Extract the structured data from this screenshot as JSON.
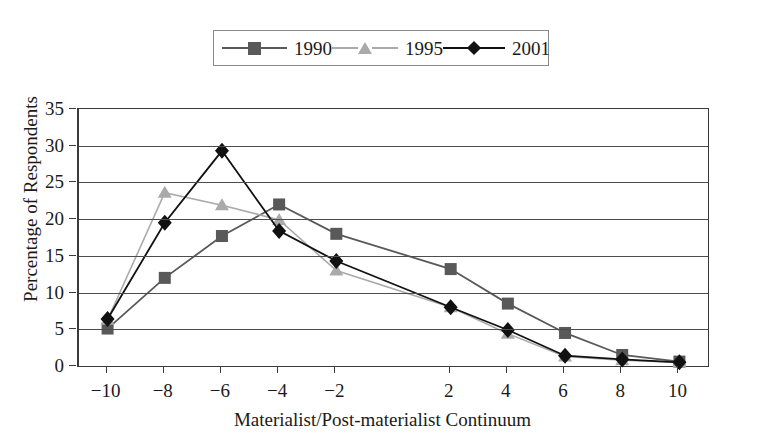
{
  "figure": {
    "ghost_text": "",
    "xlabel": "Materialist/Post-materialist Continuum",
    "ylabel": "Percentage of Respondents"
  },
  "legend": {
    "position": "top-center",
    "entries": [
      {
        "label": "1990",
        "marker": "square",
        "color": "#595959"
      },
      {
        "label": "1995",
        "marker": "triangle",
        "color": "#aaaaaa"
      },
      {
        "label": "2001",
        "marker": "diamond",
        "color": "#111111"
      }
    ]
  },
  "axes": {
    "y_ticks": [
      "0",
      "5",
      "10",
      "15",
      "20",
      "25",
      "30",
      "35"
    ],
    "x_ticks": [
      "−10",
      "−8",
      "−6",
      "−4",
      "−2",
      "2",
      "4",
      "6",
      "8",
      "10"
    ]
  },
  "chart_data": {
    "type": "line",
    "title": "",
    "subtitle": "",
    "xlabel": "Materialist/Post-materialist Continuum",
    "ylabel": "Percentage of Respondents",
    "categories": [
      "-10",
      "-8",
      "-6",
      "-4",
      "-2",
      "2",
      "4",
      "6",
      "8",
      "10"
    ],
    "x": [
      -10,
      -8,
      -6,
      -4,
      -2,
      2,
      4,
      6,
      8,
      10
    ],
    "xlim": [
      -11,
      11
    ],
    "ylim": [
      0,
      35
    ],
    "ytick_step": 5,
    "grid": "horizontal",
    "legend_position": "top-center",
    "series": [
      {
        "name": "1990",
        "marker": "square",
        "color": "#595959",
        "values": [
          5.1,
          12.0,
          17.7,
          22.0,
          18.0,
          13.2,
          8.5,
          4.5,
          1.5,
          0.6
        ]
      },
      {
        "name": "1995",
        "marker": "triangle",
        "color": "#aaaaaa",
        "values": [
          6.3,
          23.6,
          21.9,
          19.9,
          13.0,
          8.0,
          4.4,
          1.3,
          0.8,
          0.5
        ]
      },
      {
        "name": "2001",
        "marker": "diamond",
        "color": "#111111",
        "values": [
          6.4,
          19.5,
          29.3,
          18.4,
          14.3,
          8.0,
          4.9,
          1.4,
          0.9,
          0.5
        ]
      }
    ]
  }
}
